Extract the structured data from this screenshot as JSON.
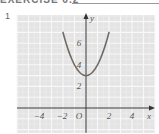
{
  "header": {
    "title": "EXERCISE 6.2"
  },
  "exercise_number": "1",
  "colors": {
    "grid_background": "#e4e4e4",
    "grid_major": "#f8f8f8",
    "grid_minor": "#eeeeee",
    "axis": "#333333",
    "curve": "#6f6a68",
    "label": "#555555"
  },
  "chart_data": {
    "type": "line",
    "title": "",
    "xlabel": "x",
    "ylabel": "y",
    "xlim": [
      -6,
      6
    ],
    "ylim": [
      -2.3,
      8.6
    ],
    "grid": true,
    "origin_label": "O",
    "x_ticks": [
      -4,
      -2,
      2,
      4
    ],
    "y_ticks": [
      2,
      4,
      6
    ],
    "x_tick_labels": [
      "−4",
      "−2",
      "2",
      "4"
    ],
    "y_tick_labels": [
      "2",
      "4",
      "6"
    ],
    "series": [
      {
        "name": "y = x^2 + 3",
        "x": [
          -2,
          -1.5,
          -1,
          -0.5,
          0,
          0.5,
          1,
          1.5,
          2
        ],
        "y": [
          7,
          5.25,
          4,
          3.25,
          3,
          3.25,
          4,
          5.25,
          7
        ]
      }
    ],
    "vertex": [
      0,
      3
    ]
  }
}
